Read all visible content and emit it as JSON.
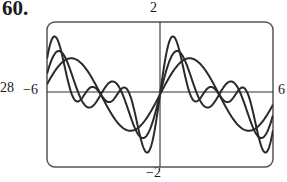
{
  "figure": {
    "problem_number": "60.",
    "cut_off_left_label": "28"
  },
  "chart_data": {
    "type": "line",
    "title": "",
    "xlabel": "",
    "ylabel": "",
    "xlim": [
      -6,
      6
    ],
    "ylim": [
      -2,
      2
    ],
    "tick_labels": {
      "xmin": "−6",
      "xmax": "6",
      "ymax": "2",
      "ymin": "−2"
    },
    "grid": false,
    "legend": null,
    "series": [
      {
        "name": "curve-1 (smooth)",
        "formula": "sin x",
        "coeffs": [
          1.0,
          0,
          0
        ]
      },
      {
        "name": "curve-2 (medium)",
        "formula": "0.6 sin x + 0.75 sin 2x",
        "coeffs": [
          0.6,
          0.75,
          0
        ]
      },
      {
        "name": "curve-3 (tall)",
        "formula": "0.6 sin x + 0.75 sin 2x + 0.55 sin 3x",
        "coeffs": [
          0.6,
          0.75,
          0.55
        ]
      }
    ],
    "key_points": {
      "common_zeros": [
        -3.14,
        0,
        3.14
      ],
      "tall_peak": {
        "x": 0.8,
        "y": 1.7
      },
      "smooth_peak": {
        "x": 1.57,
        "y": 1.0
      }
    }
  },
  "style": {
    "line_color": "#2a2a2a",
    "frame_color": "#555555",
    "axis_color": "#333333"
  }
}
